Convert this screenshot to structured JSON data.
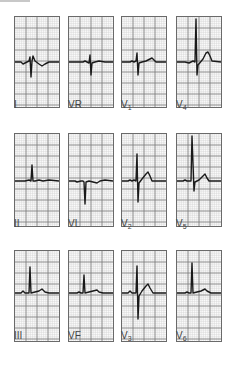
{
  "figure": {
    "grid": {
      "minor_color": "#cfcfcf",
      "major_color": "#7a7a7a",
      "trace_color": "#1a1a1a"
    }
  },
  "leads": [
    {
      "id": "I",
      "name": "I",
      "sub": "",
      "row": 0,
      "col": 0,
      "trace": "M0 45 L6 45 L8 47 L10 46 L12 45 L14 44 L15 40 L16 60 L17 44 L18 39 L20 44 L24 47 L27 49 L30 47 L34 45 L44 45"
    },
    {
      "id": "VR",
      "name": "VR",
      "sub": "",
      "row": 0,
      "col": 1,
      "trace": "M0 45 L14 45 L16 44 L18 45 L20 46 L21 38 L22 58 L23 46 L26 45 L30 44 L36 45 L44 45"
    },
    {
      "id": "V1",
      "name": "V",
      "sub": "1",
      "row": 0,
      "col": 2,
      "trace": "M0 45 L8 45 L10 44 L12 45 L14 44 L15 36 L16 58 L17 46 L20 45 L24 44 L28 42 L30 41 L32 43 L34 45 L44 45"
    },
    {
      "id": "V4",
      "name": "V",
      "sub": "4",
      "row": 0,
      "col": 3,
      "trace": "M0 45 L8 45 L12 46 L16 44 L18 45 L19 2 L20 58 L21 48 L26 42 L29 36 L31 35 L33 39 L35 44 L44 45"
    },
    {
      "id": "II",
      "name": "II",
      "sub": "",
      "row": 1,
      "col": 0,
      "trace": "M0 47 L10 47 L14 46 L16 47 L17 31 L18 47 L20 47 L24 46 L28 47 L34 46 L44 47"
    },
    {
      "id": "VL",
      "name": "VL",
      "sub": "",
      "row": 1,
      "col": 1,
      "trace": "M0 47 L6 47 L8 48 L12 47 L14 47 L15 48 L16 70 L17 48 L20 47 L24 48 L28 49 L31 47 L36 46 L44 47"
    },
    {
      "id": "V2",
      "name": "V",
      "sub": "2",
      "row": 1,
      "col": 2,
      "trace": "M0 47 L6 47 L8 46 L10 47 L12 46 L14 47 L15 20 L16 68 L17 49 L20 45 L24 40 L26 38 L28 42 L30 47 L44 47"
    },
    {
      "id": "V5",
      "name": "V",
      "sub": "5",
      "row": 1,
      "col": 3,
      "trace": "M0 47 L6 47 L8 46 L10 47 L14 47 L15 2 L17 57 L18 48 L22 46 L26 42 L28 40 L30 44 L32 47 L44 47"
    },
    {
      "id": "III",
      "name": "III",
      "sub": "",
      "row": 2,
      "col": 0,
      "trace": "M0 42 L6 42 L8 40 L10 42 L14 42 L15 16 L16 42 L20 41 L24 40 L27 38 L30 41 L34 42 L44 42"
    },
    {
      "id": "VF",
      "name": "VF",
      "sub": "",
      "row": 2,
      "col": 1,
      "trace": "M0 42 L8 42 L10 41 L12 42 L14 42 L15 24 L16 42 L20 41 L24 40 L28 39 L30 41 L34 42 L44 42"
    },
    {
      "id": "V3",
      "name": "V",
      "sub": "3",
      "row": 2,
      "col": 2,
      "trace": "M0 42 L6 42 L8 40 L10 42 L14 42 L15 15 L16 68 L17 45 L20 40 L24 35 L26 33 L28 37 L31 42 L44 42"
    },
    {
      "id": "V6",
      "name": "V",
      "sub": "6",
      "row": 2,
      "col": 3,
      "trace": "M0 42 L8 42 L10 41 L12 42 L14 42 L15 12 L16 42 L20 41 L24 40 L28 38 L30 40 L34 42 L44 42"
    }
  ]
}
